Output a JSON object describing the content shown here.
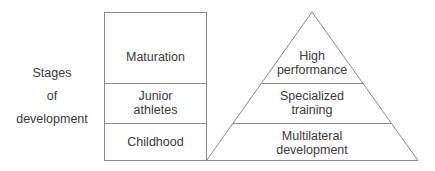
{
  "axis_label": {
    "line1": "Stages",
    "line2": "of",
    "line3": "development"
  },
  "stages_box": [
    {
      "label": "Maturation"
    },
    {
      "label_line1": "Junior",
      "label_line2": "athletes"
    },
    {
      "label": "Childhood"
    }
  ],
  "pyramid": [
    {
      "label_line1": "High",
      "label_line2": "performance"
    },
    {
      "label_line1": "Specialized",
      "label_line2": "training"
    },
    {
      "label_line1": "Multilateral",
      "label_line2": "development"
    }
  ],
  "colors": {
    "line": "#8a8a8a",
    "text": "#3a3a3a",
    "background": "#ffffff"
  }
}
